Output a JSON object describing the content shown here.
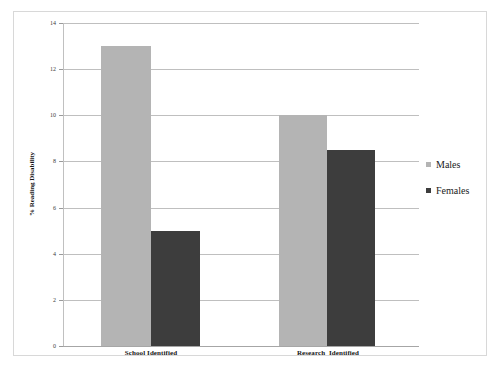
{
  "chart_data": {
    "type": "bar",
    "title": "",
    "subtitle": "",
    "xlabel": "",
    "ylabel": "% Reading Disability",
    "categories": [
      "School Identified",
      "Research  Identified"
    ],
    "series": [
      {
        "name": "Males",
        "color": "#b4b4b4",
        "values": [
          13.0,
          10.0
        ]
      },
      {
        "name": "Females",
        "color": "#3d3d3d",
        "values": [
          5.0,
          8.5
        ]
      }
    ],
    "ylim": [
      0,
      14
    ],
    "ytick_labels": [
      "0",
      "2",
      "4",
      "6",
      "8",
      "10",
      "12",
      "14"
    ],
    "ytick_values": [
      0,
      2,
      4,
      6,
      8,
      10,
      12,
      14
    ],
    "grid": true,
    "legend_position": "right",
    "frame_color": "#d8d8d8",
    "gridline_color": "#bfbfbf",
    "background_color": "#ffffff"
  },
  "legend": {
    "entries": [
      {
        "label": "Males",
        "marker": "square-swatch-icon"
      },
      {
        "label": "Females",
        "marker": "square-swatch-icon"
      }
    ]
  },
  "axes": {
    "y_title": "% Reading Disability",
    "y_ticks": [
      "14",
      "12",
      "10",
      "8",
      "6",
      "4",
      "2",
      "0"
    ],
    "x_ticks": [
      "School Identified",
      "Research  Identified"
    ]
  }
}
